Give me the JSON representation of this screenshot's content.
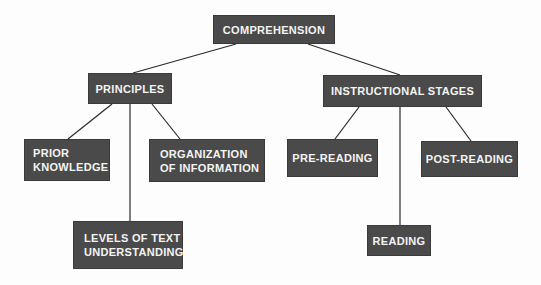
{
  "diagram": {
    "root": {
      "label": "COMPREHENSION"
    },
    "branches": [
      {
        "label": "PRINCIPLES",
        "children": [
          {
            "label": "PRIOR\nKNOWLEDGE"
          },
          {
            "label": "LEVELS OF TEXT\nUNDERSTANDING"
          },
          {
            "label": "ORGANIZATION\nOF INFORMATION"
          }
        ]
      },
      {
        "label": "INSTRUCTIONAL STAGES",
        "children": [
          {
            "label": "PRE-READING"
          },
          {
            "label": "READING"
          },
          {
            "label": "POST-READING"
          }
        ]
      }
    ],
    "colors": {
      "box": "#4a4a4a",
      "text": "#f4f4f4",
      "line": "#2a2a2a",
      "background": "#fdfdfd"
    }
  }
}
